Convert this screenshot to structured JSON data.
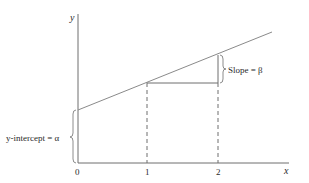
{
  "diagram": {
    "axes": {
      "x_label": "x",
      "y_label": "y",
      "x_ticks": [
        "0",
        "1",
        "2"
      ]
    },
    "annotations": {
      "slope_label": "Slope = β",
      "intercept_label": "y-intercept = α"
    },
    "colors": {
      "axis": "#6f6f6f",
      "line": "#8a8a8a",
      "text": "#2a2a2a"
    }
  }
}
